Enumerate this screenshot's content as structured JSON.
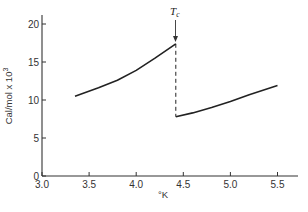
{
  "chart_data": {
    "type": "line",
    "title": "",
    "xlabel": "°K",
    "ylabel": "Cal/mol x 10³",
    "xlim": [
      3.0,
      5.7
    ],
    "ylim": [
      0,
      21
    ],
    "x_ticks": [
      "3.0",
      "3.5",
      "4.0",
      "4.5",
      "5.0",
      "5.5"
    ],
    "y_ticks": [
      "0",
      "5",
      "10",
      "15",
      "20"
    ],
    "grid": false,
    "legend": null,
    "annotations": [
      {
        "text": "Tc",
        "x": 4.42,
        "description": "critical temperature arrow marking the discontinuity"
      }
    ],
    "series": [
      {
        "name": "below Tc",
        "style": "solid",
        "points": [
          [
            3.35,
            10.5
          ],
          [
            3.6,
            11.6
          ],
          [
            3.8,
            12.6
          ],
          [
            4.0,
            13.9
          ],
          [
            4.2,
            15.5
          ],
          [
            4.42,
            17.4
          ]
        ]
      },
      {
        "name": "discontinuity at Tc",
        "style": "dashed",
        "points": [
          [
            4.42,
            17.4
          ],
          [
            4.42,
            7.8
          ]
        ]
      },
      {
        "name": "above Tc",
        "style": "solid",
        "points": [
          [
            4.42,
            7.8
          ],
          [
            4.6,
            8.3
          ],
          [
            4.8,
            9.0
          ],
          [
            5.0,
            9.8
          ],
          [
            5.2,
            10.7
          ],
          [
            5.5,
            11.9
          ]
        ]
      }
    ]
  },
  "labels": {
    "ylabel": "Cal/mol x 10",
    "ylabel_sup": "3",
    "xlabel": "°K",
    "tc_main": "T",
    "tc_sub": "c"
  }
}
